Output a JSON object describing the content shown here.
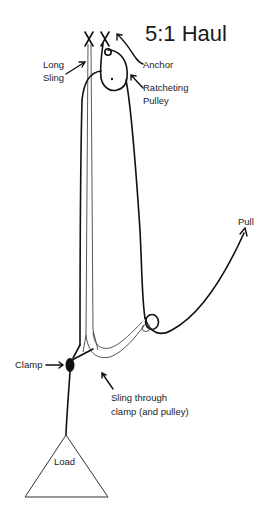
{
  "diagram": {
    "title": "5:1 Haul",
    "labels": {
      "long_sling_1": "Long",
      "long_sling_2": "Sling",
      "anchor": "Anchor",
      "ratcheting_pulley_1": "Ratcheting",
      "ratcheting_pulley_2": "Pulley",
      "pull": "Pull",
      "clamp": "Clamp",
      "sling_through_1": "Sling through",
      "sling_through_2": "clamp (and pulley)",
      "load": "Load"
    },
    "colors": {
      "ink": "#111111",
      "background": "#ffffff"
    }
  }
}
